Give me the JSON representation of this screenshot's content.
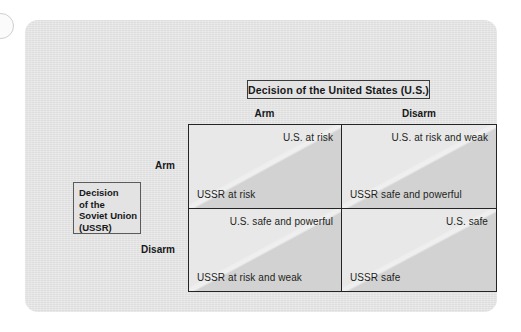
{
  "figure": {
    "kind": "payoff-matrix",
    "column_group": {
      "title": "Decision of the United States (U.S.)",
      "headers": [
        "Arm",
        "Disarm"
      ]
    },
    "row_group": {
      "title_lines": [
        "Decision",
        "of the",
        "Soviet Union",
        "(USSR)"
      ],
      "headers": [
        "Arm",
        "Disarm"
      ]
    },
    "cells": [
      {
        "row": "Arm",
        "column": "Arm",
        "top_payoff": "U.S. at risk",
        "bottom_payoff": "USSR at risk"
      },
      {
        "row": "Arm",
        "column": "Disarm",
        "top_payoff": "U.S. at risk and weak",
        "bottom_payoff": "USSR safe and powerful"
      },
      {
        "row": "Disarm",
        "column": "Arm",
        "top_payoff": "U.S. safe and powerful",
        "bottom_payoff": "USSR at risk and weak"
      },
      {
        "row": "Disarm",
        "column": "Disarm",
        "top_payoff": "U.S. safe",
        "bottom_payoff": "USSR safe"
      }
    ],
    "colors": {
      "card_background": "#e3e3e3",
      "page_background": "#ffffff",
      "matrix_border": "#242424",
      "cell_light_triangle": "#e8e8e8",
      "cell_dark_triangle": "#d2d2d2",
      "text": "#16181a"
    }
  }
}
